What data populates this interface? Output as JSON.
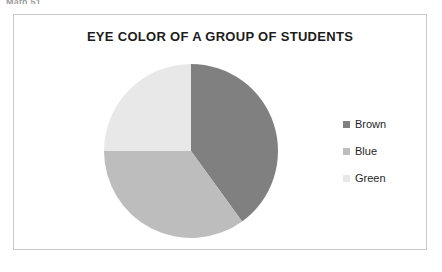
{
  "page": {
    "fragment_text": "Math 51"
  },
  "chart_frame": {
    "border_color": "#c9c9c9",
    "background": "#ffffff"
  },
  "legend": {
    "position": "right",
    "items": [
      {
        "label": "Brown",
        "swatch_name": "legend-swatch-brown",
        "color": "#808080"
      },
      {
        "label": "Blue",
        "swatch_name": "legend-swatch-blue",
        "color": "#bdbdbd"
      },
      {
        "label": "Green",
        "swatch_name": "legend-swatch-green",
        "color": "#e8e8e8"
      }
    ]
  },
  "chart_data": {
    "type": "pie",
    "title": "EYE COLOR OF A GROUP OF STUDENTS",
    "xlabel": "",
    "ylabel": "",
    "grid": false,
    "legend_position": "right",
    "start_angle_deg": 0,
    "direction": "clockwise",
    "categories": [
      "Brown",
      "Blue",
      "Green"
    ],
    "values": [
      40,
      35,
      25
    ],
    "value_unit": "percent",
    "slices": [
      {
        "label": "Brown",
        "value": 40,
        "percent": 40,
        "color": "#808080",
        "start_deg": 0,
        "end_deg": 144
      },
      {
        "label": "Blue",
        "value": 35,
        "percent": 35,
        "color": "#bdbdbd",
        "start_deg": 144,
        "end_deg": 270
      },
      {
        "label": "Green",
        "value": 25,
        "percent": 25,
        "color": "#e8e8e8",
        "start_deg": 270,
        "end_deg": 360
      }
    ],
    "data_labels_shown": false,
    "geometry": {
      "center_x": 190,
      "center_y": 150,
      "radius": 87
    }
  }
}
